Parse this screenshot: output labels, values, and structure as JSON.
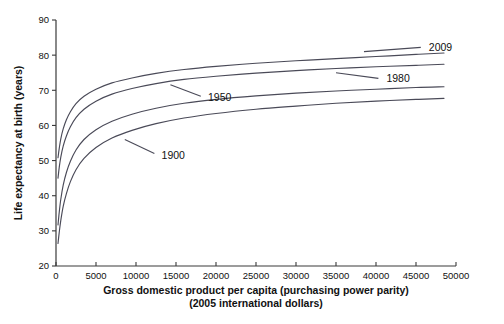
{
  "chart_data": {
    "type": "line",
    "title": "",
    "xlabel": "Gross domestic product per capita (purchasing power parity)",
    "xlabel_line2": "(2005 international dollars)",
    "ylabel": "Life expectancy at birth (years)",
    "xlim": [
      0,
      50000
    ],
    "ylim": [
      20,
      90
    ],
    "xticks": [
      0,
      5000,
      10000,
      15000,
      20000,
      25000,
      30000,
      35000,
      40000,
      45000,
      50000
    ],
    "xticklabels": [
      "0",
      "5000",
      "10000",
      "15000",
      "20000",
      "25000",
      "30000",
      "35000",
      "40000",
      "45000",
      "50000"
    ],
    "yticks": [
      20,
      30,
      40,
      50,
      60,
      70,
      80,
      90
    ],
    "yticklabels": [
      "20",
      "30",
      "40",
      "50",
      "60",
      "70",
      "80",
      "90"
    ],
    "grid": false,
    "legend_position": "inline-annotations",
    "line_color": "#4a4a58",
    "series": [
      {
        "name": "1900",
        "label": "1900",
        "label_x": 13200,
        "label_y": 51.5,
        "leader_from_x": 12300,
        "leader_from_y": 52.0,
        "leader_to_x": 8600,
        "leader_to_y": 56.0,
        "x": [
          250,
          400,
          600,
          900,
          1300,
          1800,
          2500,
          3500,
          5000,
          7000,
          9500,
          12500,
          16000,
          20000,
          25000,
          30000,
          35000,
          40000,
          45000,
          48500
        ],
        "y": [
          26.4,
          29.5,
          33.0,
          37.0,
          40.6,
          44.0,
          47.4,
          50.6,
          53.7,
          56.4,
          58.6,
          60.5,
          62.1,
          63.4,
          64.6,
          65.5,
          66.3,
          66.9,
          67.4,
          67.7
        ]
      },
      {
        "name": "1950",
        "label": "1950",
        "label_x": 19000,
        "label_y": 68.0,
        "leader_from_x": 18100,
        "leader_from_y": 68.3,
        "leader_to_x": 14300,
        "leader_to_y": 71.6,
        "x": [
          250,
          400,
          600,
          900,
          1300,
          1800,
          2500,
          3500,
          5000,
          7000,
          9500,
          12500,
          16000,
          20000,
          25000,
          30000,
          35000,
          40000,
          45000,
          48500
        ],
        "y": [
          31.7,
          35.2,
          39.0,
          43.0,
          46.6,
          49.8,
          53.0,
          56.0,
          58.8,
          61.2,
          63.2,
          64.9,
          66.3,
          67.4,
          68.4,
          69.2,
          69.8,
          70.3,
          70.8,
          71.0
        ]
      },
      {
        "name": "1980",
        "label": "1980",
        "label_x": 41300,
        "label_y": 73.3,
        "leader_from_x": 40300,
        "leader_from_y": 73.4,
        "leader_to_x": 35000,
        "leader_to_y": 75.0,
        "x": [
          250,
          400,
          600,
          900,
          1300,
          1800,
          2500,
          3500,
          5000,
          7000,
          9500,
          12500,
          16000,
          20000,
          25000,
          30000,
          35000,
          40000,
          45000,
          48500
        ],
        "y": [
          45.0,
          48.0,
          51.0,
          54.1,
          57.0,
          59.6,
          62.2,
          64.6,
          66.9,
          68.9,
          70.5,
          71.9,
          73.1,
          74.0,
          74.9,
          75.6,
          76.2,
          76.7,
          77.1,
          77.4
        ]
      },
      {
        "name": "2009",
        "label": "2009",
        "label_x": 46600,
        "label_y": 82.2,
        "leader_from_x": 45600,
        "leader_from_y": 82.2,
        "leader_to_x": 38500,
        "leader_to_y": 81.0,
        "x": [
          250,
          400,
          600,
          900,
          1300,
          1800,
          2500,
          3500,
          5000,
          7000,
          9500,
          12500,
          16000,
          20000,
          25000,
          30000,
          35000,
          40000,
          45000,
          48500
        ],
        "y": [
          50.8,
          53.4,
          56.2,
          59.0,
          61.6,
          63.9,
          66.2,
          68.3,
          70.3,
          72.1,
          73.5,
          74.8,
          75.9,
          76.8,
          77.7,
          78.4,
          79.0,
          79.6,
          80.2,
          80.6
        ]
      }
    ]
  }
}
